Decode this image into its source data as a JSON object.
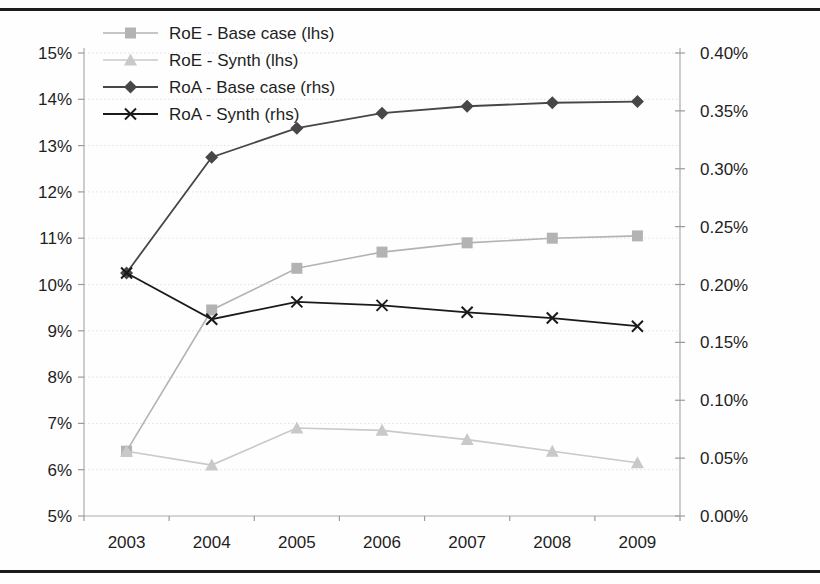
{
  "figure": {
    "background": "#fefefe",
    "rule_color": "#1c1c1c"
  },
  "chart_data": {
    "type": "line",
    "title": "",
    "x_tick_labels": [
      "2003",
      "2004",
      "2005",
      "2006",
      "2007",
      "2008",
      "2009"
    ],
    "series": [
      {
        "name": "RoE - Base case (lhs)",
        "axis": "left",
        "marker": "square",
        "color": "#b3b3b3",
        "line_width": 1.6,
        "values": [
          6.4,
          9.45,
          10.35,
          10.7,
          10.9,
          11.0,
          11.05
        ]
      },
      {
        "name": "RoE - Synth (lhs)",
        "axis": "left",
        "marker": "triangle",
        "color": "#c9c9c9",
        "line_width": 1.6,
        "values": [
          6.4,
          6.1,
          6.9,
          6.85,
          6.65,
          6.4,
          6.15
        ]
      },
      {
        "name": "RoA - Base case (rhs)",
        "axis": "right",
        "marker": "diamond",
        "color": "#474747",
        "line_width": 1.8,
        "values": [
          0.21,
          0.31,
          0.335,
          0.348,
          0.354,
          0.357,
          0.358
        ]
      },
      {
        "name": "RoA - Synth (rhs)",
        "axis": "right",
        "marker": "x",
        "color": "#1a1a1a",
        "line_width": 1.8,
        "values": [
          0.21,
          0.17,
          0.185,
          0.182,
          0.176,
          0.171,
          0.164
        ]
      }
    ],
    "left_axis": {
      "min": 5,
      "max": 15,
      "step": 1,
      "tick_labels_top_to_bottom": [
        "15%",
        "14%",
        "13%",
        "12%",
        "11%",
        "10%",
        "9%",
        "8%",
        "7%",
        "6%",
        "5%"
      ]
    },
    "right_axis": {
      "min": 0,
      "max": 0.4,
      "step": 0.05,
      "tick_labels_top_to_bottom": [
        "0.40%",
        "0.35%",
        "0.30%",
        "0.25%",
        "0.20%",
        "0.15%",
        "0.10%",
        "0.05%",
        "0.00%"
      ]
    },
    "grid": "horizontal-dotted-left-axis-steps",
    "grid_color": "#e0e0e0",
    "axis_color": "#ababab",
    "tick_color": "#9a9a9a",
    "legend_position": "top-left-inside"
  }
}
